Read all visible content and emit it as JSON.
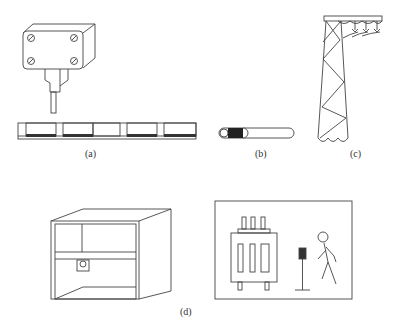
{
  "figure": {
    "panels": [
      {
        "id": "a",
        "label": "(a)",
        "description": "pressure sensor with probe above a segmented sensing strip",
        "icons": [
          "sensor-box-icon",
          "sensing-strip-icon"
        ]
      },
      {
        "id": "b",
        "label": "(b)",
        "description": "insulated cable with stripped end",
        "icons": [
          "cable-icon"
        ]
      },
      {
        "id": "c",
        "label": "(c)",
        "description": "lattice transmission tower with insulators and conductors",
        "icons": [
          "transmission-tower-icon"
        ]
      },
      {
        "id": "d",
        "label": "(d)",
        "description": "cabinet with shelf and socket; transformer, sensor on stand and walking person",
        "icons": [
          "cabinet-icon",
          "transformer-icon",
          "sensor-stand-icon",
          "person-icon"
        ]
      }
    ]
  },
  "colors": {
    "stroke": "#444444",
    "dark_fill": "#333333"
  }
}
